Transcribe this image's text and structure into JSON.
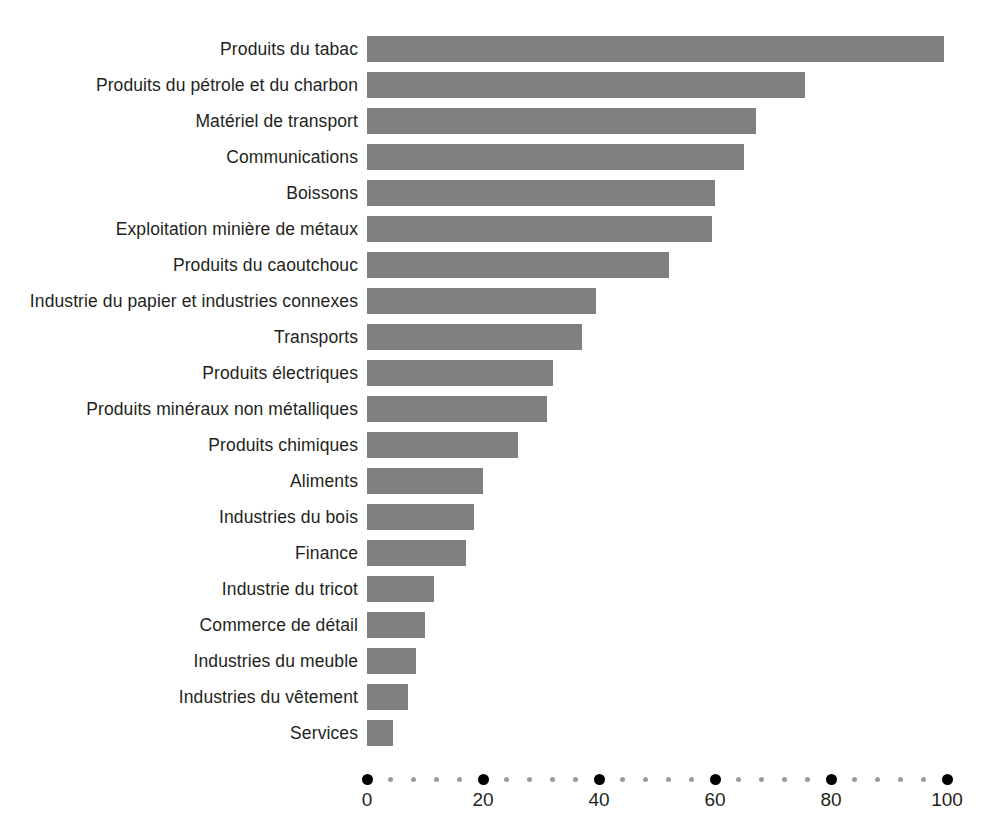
{
  "chart": {
    "title": "",
    "background_color": "#ffffff",
    "bar_color": "#808080",
    "axis_major_dot_color": "#000000",
    "axis_minor_dot_color": "#9a9a9a"
  },
  "chart_data": {
    "type": "bar",
    "orientation": "horizontal",
    "title": "",
    "xlabel": "",
    "ylabel": "",
    "xlim": [
      0,
      100
    ],
    "grid": false,
    "legend": null,
    "xticks": [
      0,
      20,
      40,
      60,
      80,
      100
    ],
    "xtick_labels": [
      "0",
      "20",
      "40",
      "60",
      "80",
      "100"
    ],
    "minor_tick_interval": 4,
    "categories": [
      "Produits du tabac",
      "Produits du pétrole et du charbon",
      "Matériel de transport",
      "Communications",
      "Boissons",
      "Exploitation minière de métaux",
      "Produits du caoutchouc",
      "Industrie du papier et industries connexes",
      "Transports",
      "Produits électriques",
      "Produits minéraux non métalliques",
      "Produits chimiques",
      "Aliments",
      "Industries du bois",
      "Finance",
      "Industrie du tricot",
      "Commerce de détail",
      "Industries du meuble",
      "Industries du vêtement",
      "Services"
    ],
    "values": [
      99.5,
      75.5,
      67,
      65,
      60,
      59.5,
      52,
      39.5,
      37,
      32,
      31,
      26,
      20,
      18.5,
      17,
      11.5,
      10,
      8.5,
      7,
      4.5
    ]
  }
}
